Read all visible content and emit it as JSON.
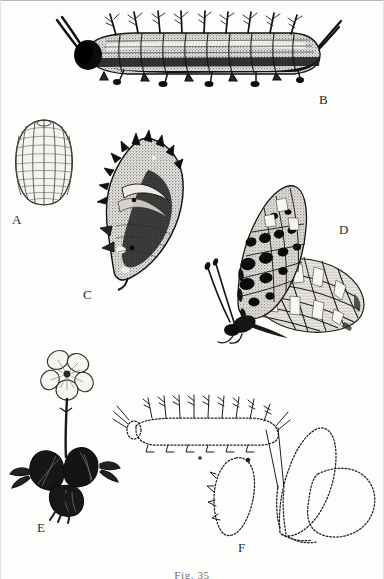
{
  "figure": {
    "caption": "Fig. 35",
    "style": "engraving",
    "ink_color": "#111111",
    "page_color": "#fdfdfb"
  },
  "panels": [
    {
      "id": "A",
      "label": "A",
      "name": "egg",
      "description": "Ribbed dome-shaped butterfly egg with vertical keels and fine cross-ribs"
    },
    {
      "id": "B",
      "label": "B",
      "name": "larva-detailed",
      "description": "Mature spiny caterpillar in lateral view with branched scoli and two long head horns"
    },
    {
      "id": "C",
      "label": "C",
      "name": "pupa-detailed",
      "description": "Suspended chrysalis with dorsal spined projections and angular head"
    },
    {
      "id": "D",
      "label": "D",
      "name": "adult-butterfly",
      "description": "Adult fritillary at rest, lateral view, black-spotted forewing and silver-banded hindwing underside"
    },
    {
      "id": "E",
      "label": "E",
      "name": "host-plant-violet",
      "description": "Violet host plant with five-petalled flower and dark heart-shaped leaves"
    },
    {
      "id": "F",
      "label": "F",
      "name": "outline-stages",
      "description": "Dotted contour outlines of larva, pupa and adult butterfly"
    }
  ]
}
